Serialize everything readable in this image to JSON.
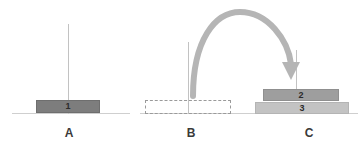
{
  "diagram": {
    "background_color": "#ffffff"
  },
  "pegs": [
    {
      "id": "A",
      "label": "A",
      "label_left": 62,
      "label_top": 127,
      "ground_left": 12,
      "ground_top": 113,
      "ground_width": 118,
      "rod_left": 68,
      "rod_top": 24,
      "rod_height": 90,
      "rod_color": "#c2c2c2",
      "ground_color": "#cfcfcf",
      "disks": [
        {
          "label": "1",
          "left": 36,
          "top": 100,
          "width": 64,
          "height": 13,
          "color": "#7d7d7d",
          "border_color": "#6e6e6e",
          "label_color": "#1f1f1f"
        }
      ],
      "ghost_disks": []
    },
    {
      "id": "B",
      "label": "B",
      "label_left": 184,
      "label_top": 127,
      "ground_left": 140,
      "ground_top": 113,
      "ground_width": 118,
      "rod_left": 188,
      "rod_top": 42,
      "rod_height": 72,
      "rod_color": "#c2c2c2",
      "ground_color": "#cfcfcf",
      "disks": [],
      "ghost_disks": [
        {
          "left": 145,
          "top": 100,
          "width": 86,
          "height": 14,
          "border_color": "#9a9a9a"
        }
      ]
    },
    {
      "id": "C",
      "label": "C",
      "label_left": 302,
      "label_top": 127,
      "ground_left": 258,
      "ground_top": 113,
      "ground_width": 100,
      "rod_left": 296,
      "rod_top": 50,
      "rod_height": 50,
      "rod_color": "#c2c2c2",
      "ground_color": "#cfcfcf",
      "disks": [
        {
          "label": "2",
          "left": 263,
          "top": 89,
          "width": 76,
          "height": 12,
          "color": "#9e9e9e",
          "border_color": "#8f8f8f",
          "label_color": "#1f1f1f"
        },
        {
          "label": "3",
          "left": 255,
          "top": 102,
          "width": 94,
          "height": 12,
          "color": "#c3c3c3",
          "border_color": "#b4b4b4",
          "label_color": "#1f1f1f"
        }
      ],
      "ghost_disks": []
    }
  ],
  "move_arrow": {
    "name": "move-arrow",
    "from_peg": "B",
    "to_peg": "C",
    "color": "#b5b5b5",
    "stroke_width": 6,
    "path": "M 193 96 C 193 40, 215 12, 240 12 C 268 12, 288 40, 291 66",
    "head_points": "283,64 299,64 291,80",
    "description": "curved arrow from peg B to peg C"
  }
}
